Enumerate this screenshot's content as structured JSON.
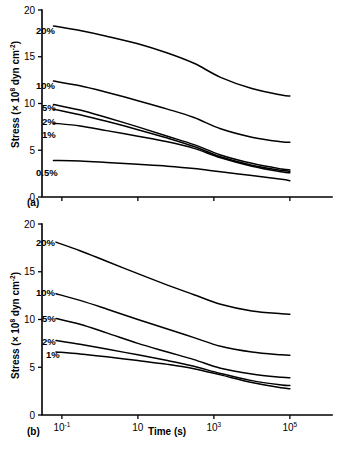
{
  "figure": {
    "background": "#ffffff",
    "line_color": "#000000",
    "width": 337,
    "height": 454
  },
  "panels": [
    {
      "tag": "(a)",
      "ylabel": "Stress (× 10⁸ dyn cm⁻²)",
      "ylabel_prefix": "Stress (× 10",
      "ylabel_exp1": "8",
      "ylabel_mid": " dyn cm",
      "ylabel_exp2": "-2",
      "ylabel_suffix": ")",
      "xlabel": "",
      "yticks": [
        "0",
        "5",
        "10",
        "15",
        "20"
      ],
      "ytick_values": [
        0,
        5,
        10,
        15,
        20
      ],
      "xticks": [
        "10-1",
        "10",
        "103",
        "105"
      ],
      "curve_labels": [
        "20%",
        "10%",
        "5%",
        "2%",
        "1%",
        "0.5%"
      ]
    },
    {
      "tag": "(b)",
      "ylabel": "Stress (× 10⁸ dyn cm⁻²)",
      "ylabel_prefix": "Stress (× 10",
      "ylabel_exp1": "8",
      "ylabel_mid": " dyn cm",
      "ylabel_exp2": "-2",
      "ylabel_suffix": ")",
      "xlabel": "Time (s)",
      "yticks": [
        "0",
        "5",
        "10",
        "15",
        "20"
      ],
      "ytick_values": [
        0,
        5,
        10,
        15,
        20
      ],
      "xticks": [
        "10-1",
        "10",
        "103",
        "105"
      ],
      "curve_labels": [
        "20%",
        "10%",
        "5%",
        "2%",
        "1%"
      ]
    }
  ],
  "chart_data": [
    {
      "type": "line",
      "panel": "(a)",
      "title": "",
      "xlabel": "Time (s)",
      "ylabel": "Stress (x 10^8 dyn cm^-2)",
      "xscale": "log",
      "xtick_labels": [
        "10-1",
        "10",
        "103",
        "105"
      ],
      "xtick_values": [
        0.1,
        10,
        1000,
        100000
      ],
      "xlim": [
        0.03,
        300000
      ],
      "ylim": [
        0,
        20
      ],
      "ytick_values": [
        0,
        5,
        10,
        15,
        20
      ],
      "grid": false,
      "legend": "inline-curve-labels",
      "x": [
        0.06,
        0.3,
        1.5,
        10,
        60,
        300,
        1500,
        10000,
        60000,
        100000
      ],
      "series": [
        {
          "name": "20%",
          "values": [
            18.3,
            17.8,
            17.2,
            16.4,
            15.4,
            14.3,
            12.8,
            11.6,
            10.9,
            10.8
          ]
        },
        {
          "name": "10%",
          "values": [
            12.4,
            11.9,
            11.2,
            10.3,
            9.4,
            8.5,
            7.3,
            6.4,
            5.9,
            5.85
          ]
        },
        {
          "name": "5%",
          "values": [
            9.9,
            9.3,
            8.5,
            7.5,
            6.5,
            5.6,
            4.5,
            3.6,
            3.0,
            2.9
          ]
        },
        {
          "name": "2%",
          "values": [
            9.4,
            8.8,
            8.1,
            7.2,
            6.3,
            5.4,
            4.3,
            3.4,
            2.85,
            2.75
          ]
        },
        {
          "name": "1%",
          "values": [
            7.9,
            7.6,
            7.1,
            6.5,
            5.9,
            5.2,
            4.2,
            3.3,
            2.7,
            2.6
          ]
        },
        {
          "name": "0.5%",
          "values": [
            3.9,
            3.85,
            3.7,
            3.5,
            3.3,
            3.05,
            2.7,
            2.3,
            1.9,
            1.75
          ]
        }
      ]
    },
    {
      "type": "line",
      "panel": "(b)",
      "title": "",
      "xlabel": "Time (s)",
      "ylabel": "Stress (x 10^8 dyn cm^-2)",
      "xscale": "log",
      "xtick_labels": [
        "10-1",
        "10",
        "103",
        "105"
      ],
      "xtick_values": [
        0.1,
        10,
        1000,
        100000
      ],
      "xlim": [
        0.03,
        300000
      ],
      "ylim": [
        0,
        20
      ],
      "ytick_values": [
        0,
        5,
        10,
        15,
        20
      ],
      "grid": false,
      "legend": "inline-curve-labels",
      "x": [
        0.07,
        0.3,
        1.5,
        10,
        60,
        300,
        1500,
        10000,
        60000,
        100000
      ],
      "series": [
        {
          "name": "20%",
          "values": [
            18.1,
            17.2,
            16.1,
            14.8,
            13.6,
            12.6,
            11.6,
            10.9,
            10.6,
            10.55
          ]
        },
        {
          "name": "10%",
          "values": [
            12.7,
            12.0,
            11.1,
            10.0,
            9.0,
            8.1,
            7.2,
            6.6,
            6.3,
            6.25
          ]
        },
        {
          "name": "5%",
          "values": [
            10.1,
            9.5,
            8.6,
            7.5,
            6.6,
            5.8,
            4.9,
            4.3,
            3.95,
            3.9
          ]
        },
        {
          "name": "2%",
          "values": [
            7.8,
            7.4,
            6.9,
            6.3,
            5.7,
            5.1,
            4.35,
            3.6,
            3.15,
            3.1
          ]
        },
        {
          "name": "1%",
          "values": [
            6.6,
            6.4,
            6.1,
            5.7,
            5.3,
            4.85,
            4.2,
            3.4,
            2.85,
            2.75
          ]
        }
      ]
    }
  ]
}
